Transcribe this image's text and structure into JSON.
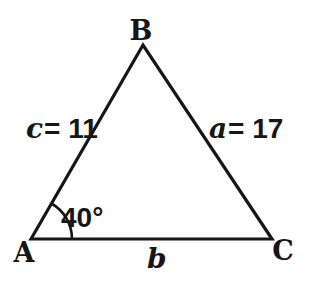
{
  "figure": {
    "type": "triangle",
    "vertices": {
      "top": "B",
      "bottom_left": "A",
      "bottom_right": "C"
    },
    "sides": {
      "left": {
        "var": "c",
        "value": "= 11"
      },
      "right": {
        "var": "a",
        "value": "= 17"
      },
      "bottom": {
        "var": "b"
      }
    },
    "angle_at_a": {
      "label": "40°",
      "degrees": 40
    }
  },
  "colors": {
    "ink": "#161616",
    "background": "#ffffff"
  }
}
